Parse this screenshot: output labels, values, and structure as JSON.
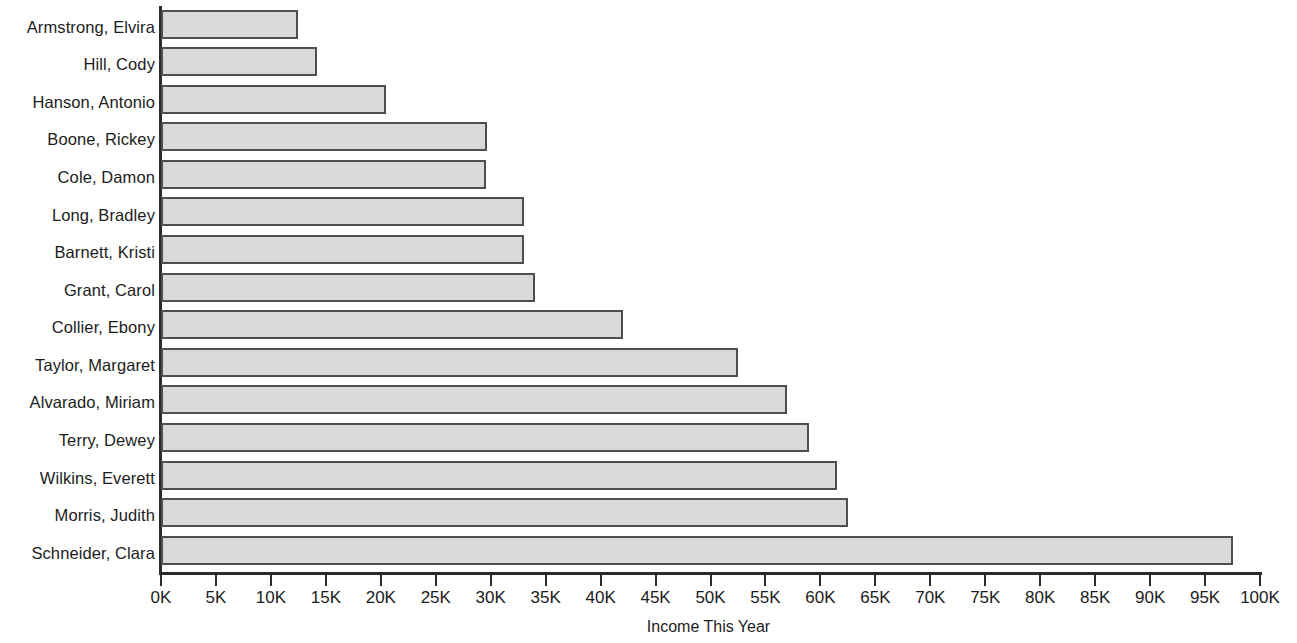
{
  "chart_data": {
    "type": "bar",
    "orientation": "horizontal",
    "title": "",
    "xlabel": "Income This Year",
    "ylabel": "",
    "xlim": [
      0,
      100000
    ],
    "grid": false,
    "legend": null,
    "x_tick_labels": [
      "0K",
      "5K",
      "10K",
      "15K",
      "20K",
      "25K",
      "30K",
      "35K",
      "40K",
      "45K",
      "50K",
      "55K",
      "60K",
      "65K",
      "70K",
      "75K",
      "80K",
      "85K",
      "90K",
      "95K",
      "100K"
    ],
    "x_tick_values": [
      0,
      5000,
      10000,
      15000,
      20000,
      25000,
      30000,
      35000,
      40000,
      45000,
      50000,
      55000,
      60000,
      65000,
      70000,
      75000,
      80000,
      85000,
      90000,
      95000,
      100000
    ],
    "categories": [
      "Armstrong, Elvira",
      "Hill, Cody",
      "Hanson, Antonio",
      "Boone, Rickey",
      "Cole, Damon",
      "Long, Bradley",
      "Barnett, Kristi",
      "Grant, Carol",
      "Collier, Ebony",
      "Taylor, Margaret",
      "Alvarado, Miriam",
      "Terry, Dewey",
      "Wilkins, Everett",
      "Morris, Judith",
      "Schneider, Clara"
    ],
    "values": [
      12500,
      14200,
      20500,
      29700,
      29600,
      33000,
      33000,
      34000,
      42000,
      52500,
      57000,
      59000,
      61500,
      62500,
      97500
    ],
    "bars": [
      {
        "label": "Armstrong, Elvira",
        "value": 12500,
        "value_label": "12.5K"
      },
      {
        "label": "Hill, Cody",
        "value": 14200,
        "value_label": "14.2K"
      },
      {
        "label": "Hanson, Antonio",
        "value": 20500,
        "value_label": "20.5K"
      },
      {
        "label": "Boone, Rickey",
        "value": 29700,
        "value_label": "29.7K"
      },
      {
        "label": "Cole, Damon",
        "value": 29600,
        "value_label": "29.6K"
      },
      {
        "label": "Long, Bradley",
        "value": 33000,
        "value_label": "33K"
      },
      {
        "label": "Barnett, Kristi",
        "value": 33000,
        "value_label": "33K"
      },
      {
        "label": "Grant, Carol",
        "value": 34000,
        "value_label": "34K"
      },
      {
        "label": "Collier, Ebony",
        "value": 42000,
        "value_label": "42K"
      },
      {
        "label": "Taylor, Margaret",
        "value": 52500,
        "value_label": "52.5K"
      },
      {
        "label": "Alvarado, Miriam",
        "value": 57000,
        "value_label": "57K"
      },
      {
        "label": "Terry, Dewey",
        "value": 59000,
        "value_label": "59K"
      },
      {
        "label": "Wilkins, Everett",
        "value": 61500,
        "value_label": "61.5K"
      },
      {
        "label": "Morris, Judith",
        "value": 62500,
        "value_label": "62.5K"
      },
      {
        "label": "Schneider, Clara",
        "value": 97500,
        "value_label": "97.5K"
      }
    ]
  },
  "colors": {
    "bar_fill": "#d9d9d9",
    "bar_border": "#4f4f4f",
    "axis": "#2b2b2b",
    "text": "#1c1c1c",
    "background": "#ffffff"
  }
}
